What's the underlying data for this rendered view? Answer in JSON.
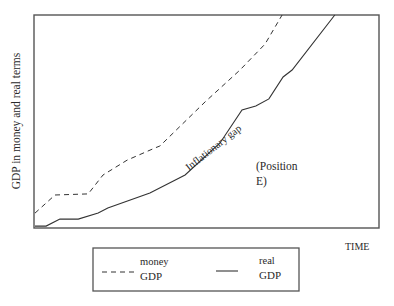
{
  "chart_data": {
    "type": "line",
    "title": "",
    "xlabel": "TIME",
    "ylabel": "GDP in money and real terms",
    "xlim": [
      0,
      100
    ],
    "ylim": [
      0,
      100
    ],
    "grid": false,
    "ticks": false,
    "legend_position": "bottom-center",
    "series": [
      {
        "name": "money GDP",
        "legend_lines": [
          "money",
          "GDP"
        ],
        "style": "dashed",
        "points": [
          [
            0.3,
            7.0
          ],
          [
            6.1,
            15.5
          ],
          [
            15.7,
            16.0
          ],
          [
            20.0,
            24.9
          ],
          [
            27.0,
            31.9
          ],
          [
            35.1,
            37.6
          ],
          [
            36.5,
            38.5
          ],
          [
            49.6,
            59.2
          ],
          [
            59.7,
            74.2
          ],
          [
            67.0,
            86.4
          ],
          [
            71.9,
            100.0
          ]
        ]
      },
      {
        "name": "real GDP",
        "legend_lines": [
          "real",
          "GDP"
        ],
        "style": "solid",
        "points": [
          [
            0.3,
            0.9
          ],
          [
            3.5,
            0.9
          ],
          [
            7.5,
            4.2
          ],
          [
            12.8,
            4.2
          ],
          [
            18.6,
            7.0
          ],
          [
            21.4,
            9.4
          ],
          [
            33.6,
            16.4
          ],
          [
            43.8,
            24.9
          ],
          [
            53.9,
            39.9
          ],
          [
            60.3,
            55.4
          ],
          [
            64.3,
            57.3
          ],
          [
            68.1,
            60.6
          ],
          [
            72.2,
            70.9
          ],
          [
            74.8,
            74.2
          ],
          [
            87.2,
            100.0
          ]
        ]
      }
    ],
    "annotations": [
      {
        "text": "Inflationary gap",
        "x": 43.5,
        "y": 37.0,
        "rotation": -38
      },
      {
        "text_lines": [
          "(Position",
          "E)"
        ],
        "x": 65.2,
        "y": 35.0
      }
    ]
  },
  "labels": {
    "y_axis": "GDP in money and real terms",
    "x_axis": "TIME",
    "gap": "Inflationary gap",
    "position_line1": "(Position",
    "position_line2": "E)",
    "legend_money_line1": "money",
    "legend_money_line2": "GDP",
    "legend_real_line1": "real",
    "legend_real_line2": "GDP"
  },
  "colors": {
    "line": "#333333",
    "frame": "#555555",
    "background": "#ffffff"
  }
}
